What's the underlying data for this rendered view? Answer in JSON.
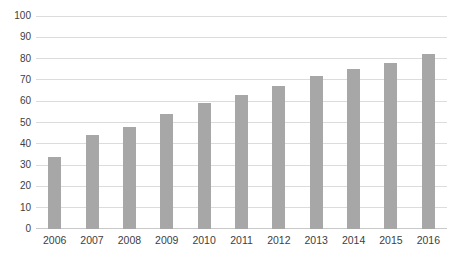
{
  "chart_data": {
    "type": "bar",
    "title": "",
    "xlabel": "",
    "ylabel": "",
    "categories": [
      "2006",
      "2007",
      "2008",
      "2009",
      "2010",
      "2011",
      "2012",
      "2013",
      "2014",
      "2015",
      "2016"
    ],
    "values": [
      34,
      44,
      48,
      54,
      59,
      63,
      67,
      72,
      75,
      78,
      82
    ],
    "ylim": [
      0,
      100
    ],
    "yticks": [
      0,
      10,
      20,
      30,
      40,
      50,
      60,
      70,
      80,
      90,
      100
    ],
    "grid": true,
    "legend": "none",
    "bar_color": "#a7a7a7",
    "gridline_color": "#dcdcdc",
    "axis_line_color": "#c9c9c9",
    "label_color": "#404040",
    "background_color": "#ffffff"
  }
}
